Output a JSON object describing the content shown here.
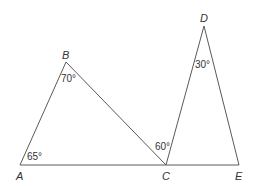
{
  "diagram": {
    "type": "geometry",
    "points": {
      "A": {
        "label": "A"
      },
      "B": {
        "label": "B"
      },
      "C": {
        "label": "C"
      },
      "D": {
        "label": "D"
      },
      "E": {
        "label": "E"
      }
    },
    "segments": [
      [
        "A",
        "B"
      ],
      [
        "B",
        "C"
      ],
      [
        "A",
        "E"
      ],
      [
        "C",
        "D"
      ],
      [
        "D",
        "E"
      ]
    ],
    "angles": {
      "A": "65°",
      "B": "70°",
      "C": "60°",
      "D": "30°"
    }
  }
}
